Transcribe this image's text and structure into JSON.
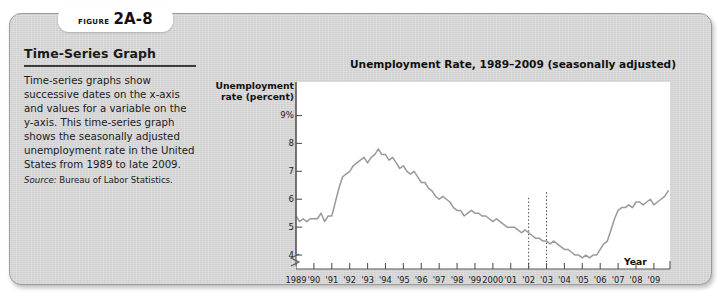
{
  "figure": {
    "tab_word": "Figure",
    "tab_number": "2A-8",
    "heading": "Time-Series Graph",
    "body": "Time-series graphs show successive dates on the x-axis and values for a variable on the y-axis. This time-series graph shows the seasonally adjusted unemployment rate in the United States from 1989 to late 2009.",
    "source_label": "Source:",
    "source_text": "Bureau of Labor Statistics."
  },
  "colors": {
    "card_background": "#d6d6d6",
    "card_border": "#9a9a9a",
    "plot_background": "#ffffff",
    "line": "#999999",
    "axis": "#555555",
    "text": "#1a1a1a"
  },
  "chart_data": {
    "type": "line",
    "title": "Unemployment Rate, 1989–2009 (seasonally adjusted)",
    "xlabel": "Year",
    "ylabel": "Unemployment rate (percent)",
    "ylim": [
      3.5,
      10.2
    ],
    "xlim": [
      1989,
      2009.9
    ],
    "grid": false,
    "legend": null,
    "y_axis_break": true,
    "y_ticks": [
      "9%",
      "8",
      "7",
      "6",
      "5",
      "4"
    ],
    "y_tick_values": [
      9,
      8,
      7,
      6,
      5,
      4
    ],
    "x_ticks": [
      "1989",
      "'90",
      "'91",
      "'92",
      "'93",
      "'94",
      "'95",
      "'96",
      "'97",
      "'98",
      "'99",
      "2000",
      "'01",
      "'02",
      "'03",
      "'04",
      "'05",
      "'06",
      "'07",
      "'08",
      "'09"
    ],
    "x_tick_values": [
      1989,
      1990,
      1991,
      1992,
      1993,
      1994,
      1995,
      1996,
      1997,
      1998,
      1999,
      2000,
      2001,
      2002,
      2003,
      2004,
      2005,
      2006,
      2007,
      2008,
      2009
    ],
    "annotations": [
      {
        "type": "dotted-vertical",
        "x": 2002.0,
        "y_top": 6.05,
        "label": "recession-marker-2002"
      },
      {
        "type": "dotted-vertical",
        "x": 2003.0,
        "y_top": 6.25,
        "label": "recession-marker-2003"
      }
    ],
    "series": [
      {
        "name": "Unemployment rate (percent)",
        "x": [
          1989.0,
          1989.2,
          1989.4,
          1989.6,
          1989.8,
          1990.0,
          1990.2,
          1990.4,
          1990.6,
          1990.8,
          1991.0,
          1991.2,
          1991.4,
          1991.6,
          1991.8,
          1992.0,
          1992.2,
          1992.4,
          1992.6,
          1992.8,
          1993.0,
          1993.2,
          1993.4,
          1993.6,
          1993.8,
          1994.0,
          1994.2,
          1994.4,
          1994.6,
          1994.8,
          1995.0,
          1995.2,
          1995.4,
          1995.6,
          1995.8,
          1996.0,
          1996.2,
          1996.4,
          1996.6,
          1996.8,
          1997.0,
          1997.2,
          1997.4,
          1997.6,
          1997.8,
          1998.0,
          1998.2,
          1998.4,
          1998.6,
          1998.8,
          1999.0,
          1999.2,
          1999.4,
          1999.6,
          1999.8,
          2000.0,
          2000.2,
          2000.4,
          2000.6,
          2000.8,
          2001.0,
          2001.2,
          2001.4,
          2001.6,
          2001.8,
          2002.0,
          2002.2,
          2002.4,
          2002.6,
          2002.8,
          2003.0,
          2003.2,
          2003.4,
          2003.6,
          2003.8,
          2004.0,
          2004.2,
          2004.4,
          2004.6,
          2004.8,
          2005.0,
          2005.2,
          2005.4,
          2005.6,
          2005.8,
          2006.0,
          2006.2,
          2006.4,
          2006.6,
          2006.8,
          2007.0,
          2007.2,
          2007.4,
          2007.6,
          2007.8,
          2008.0,
          2008.2,
          2008.4,
          2008.6,
          2008.8,
          2009.0,
          2009.2,
          2009.4,
          2009.6,
          2009.8
        ],
        "y": [
          5.4,
          5.2,
          5.3,
          5.2,
          5.3,
          5.3,
          5.3,
          5.5,
          5.2,
          5.4,
          5.4,
          5.9,
          6.4,
          6.8,
          6.9,
          7.0,
          7.2,
          7.3,
          7.4,
          7.5,
          7.3,
          7.5,
          7.6,
          7.8,
          7.6,
          7.6,
          7.4,
          7.5,
          7.3,
          7.1,
          7.2,
          7.0,
          6.9,
          7.0,
          6.8,
          6.6,
          6.6,
          6.4,
          6.3,
          6.1,
          6.0,
          6.1,
          6.0,
          5.9,
          5.7,
          5.6,
          5.6,
          5.4,
          5.5,
          5.6,
          5.5,
          5.5,
          5.4,
          5.4,
          5.3,
          5.2,
          5.3,
          5.2,
          5.1,
          5.0,
          5.0,
          5.0,
          4.9,
          4.8,
          4.9,
          4.8,
          4.7,
          4.6,
          4.6,
          4.5,
          4.5,
          4.4,
          4.5,
          4.4,
          4.3,
          4.2,
          4.2,
          4.1,
          4.0,
          4.0,
          3.9,
          4.0,
          3.9,
          4.0,
          4.0,
          4.2,
          4.4,
          4.5,
          4.9,
          5.3,
          5.6,
          5.7,
          5.7,
          5.8,
          5.7,
          5.9,
          5.9,
          5.8,
          5.9,
          6.0,
          5.8,
          5.9,
          6.0,
          6.1,
          6.3
        ],
        "y_second_half": [
          6.3,
          6.2,
          6.1,
          6.0,
          6.1,
          6.0,
          5.9,
          5.8,
          5.8,
          5.7,
          5.6,
          5.6,
          5.5,
          5.4,
          5.5,
          5.4,
          5.3,
          5.2,
          5.1,
          5.1,
          5.0,
          4.9,
          4.8,
          4.7,
          4.7,
          4.6,
          4.6,
          4.5,
          4.5,
          4.6,
          4.4,
          4.5,
          4.4,
          4.6,
          4.7,
          4.9,
          5.0,
          5.4,
          5.8,
          6.2,
          6.6,
          7.2,
          7.8,
          8.5,
          9.0,
          9.4,
          9.5,
          9.7,
          9.8,
          10.0
        ]
      }
    ],
    "description_points": [
      {
        "year": 1989.0,
        "value": 5.4,
        "note": "start"
      },
      {
        "year": 1992.7,
        "value": 7.8,
        "note": "early-1990s recession peak"
      },
      {
        "year": 2000.4,
        "value": 3.9,
        "note": "late-1990s expansion trough"
      },
      {
        "year": 2003.3,
        "value": 6.3,
        "note": "early-2000s recession peak"
      },
      {
        "year": 2006.8,
        "value": 4.4,
        "note": "mid-2000s trough"
      },
      {
        "year": 2009.8,
        "value": 10.0,
        "note": "Great Recession peak"
      }
    ]
  }
}
